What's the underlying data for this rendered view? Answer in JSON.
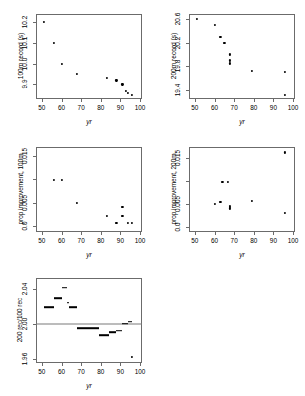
{
  "figure": {
    "background": "#ffffff",
    "point_color": "#000000",
    "axis_color": "#6b6b6b",
    "refline_color": "#7a7a7a"
  },
  "chart_data": [
    {
      "id": "panel-100m-record",
      "type": "scatter",
      "title": "",
      "xlabel": "yr",
      "ylabel": "100m record (s)",
      "xlim": [
        47,
        101
      ],
      "ylim": [
        9.83,
        10.24
      ],
      "xticks": [
        50,
        60,
        70,
        80,
        90,
        100
      ],
      "xticklabels": [
        "50",
        "60",
        "70",
        "80",
        "90",
        "100"
      ],
      "yticks": [
        9.9,
        10.0,
        10.1,
        10.2
      ],
      "yticklabels": [
        "9.9",
        "10.0",
        "10.1",
        "10.2"
      ],
      "grid": false,
      "legend": "none",
      "x": [
        51,
        56,
        60,
        68,
        83,
        88,
        91,
        93,
        94,
        96
      ],
      "y": [
        10.2,
        10.1,
        10.0,
        9.95,
        9.93,
        9.92,
        9.9,
        9.87,
        9.86,
        9.85
      ]
    },
    {
      "id": "panel-200m-record",
      "type": "scatter",
      "title": "",
      "xlabel": "yr",
      "ylabel": "200m record (s)",
      "xlim": [
        47,
        101
      ],
      "ylim": [
        19.25,
        20.68
      ],
      "xticks": [
        50,
        60,
        70,
        80,
        90,
        100
      ],
      "xticklabels": [
        "50",
        "60",
        "70",
        "80",
        "90",
        "100"
      ],
      "yticks": [
        19.4,
        19.8,
        20.2,
        20.6
      ],
      "yticklabels": [
        "19.4",
        "19.8",
        "20.2",
        "20.6"
      ],
      "grid": false,
      "legend": "none",
      "x": [
        51,
        60,
        63,
        65,
        68,
        68,
        68,
        79,
        96,
        96
      ],
      "y": [
        20.6,
        20.5,
        20.3,
        20.2,
        20.0,
        19.9,
        19.85,
        19.72,
        19.7,
        19.32
      ]
    },
    {
      "id": "panel-prop-improvement-100m",
      "type": "scatter",
      "title": "",
      "xlabel": "yr",
      "ylabel": "prop improvement, 100m",
      "xlim": [
        47,
        101
      ],
      "ylim": [
        -0.0012,
        0.0168
      ],
      "xticks": [
        50,
        60,
        70,
        80,
        90,
        100
      ],
      "xticklabels": [
        "50",
        "60",
        "70",
        "80",
        "90",
        "100"
      ],
      "yticks": [
        0.0,
        0.005,
        0.01,
        0.015
      ],
      "yticklabels": [
        "0.0",
        "0.005",
        "",
        "0.015"
      ],
      "grid": false,
      "legend": "none",
      "x": [
        56,
        60,
        68,
        83,
        88,
        91,
        91,
        94,
        96
      ],
      "y": [
        0.0098,
        0.0098,
        0.005,
        0.0022,
        0.0008,
        0.0041,
        0.0022,
        0.0008,
        0.0008
      ]
    },
    {
      "id": "panel-prop-improvement-200m",
      "type": "scatter",
      "title": "",
      "xlabel": "yr",
      "ylabel": "prop improvement, 200m",
      "xlim": [
        47,
        101
      ],
      "ylim": [
        -0.0012,
        0.0175
      ],
      "xticks": [
        50,
        60,
        70,
        80,
        90,
        100
      ],
      "xticklabels": [
        "50",
        "60",
        "70",
        "80",
        "90",
        "100"
      ],
      "yticks": [
        0.0,
        0.005,
        0.01,
        0.015
      ],
      "yticklabels": [
        "0.0",
        "0.005",
        "",
        "0.015"
      ],
      "grid": false,
      "legend": "none",
      "x": [
        60,
        63,
        64,
        67,
        68,
        68,
        68,
        79,
        96,
        96
      ],
      "y": [
        0.0049,
        0.0055,
        0.0098,
        0.0098,
        0.0046,
        0.0043,
        0.004,
        0.0056,
        0.0163,
        0.003
      ]
    },
    {
      "id": "panel-ratio-200-over-100",
      "type": "line",
      "drawstyle": "steps",
      "title": "",
      "xlabel": "yr",
      "ylabel": "200 rec/100 rec",
      "xlim": [
        47,
        101
      ],
      "ylim": [
        1.955,
        2.052
      ],
      "xticks": [
        50,
        60,
        70,
        80,
        90,
        100
      ],
      "xticklabels": [
        "50",
        "60",
        "70",
        "80",
        "90",
        "100"
      ],
      "yticks": [
        1.96,
        2.0,
        2.04
      ],
      "yticklabels": [
        "1.96",
        "2.00",
        "2.04"
      ],
      "grid": false,
      "legend": "none",
      "reference_line_y": 2.0,
      "segments": [
        {
          "x0": 51,
          "x1": 56,
          "y": 2.019
        },
        {
          "x0": 56,
          "x1": 60,
          "y": 2.029
        },
        {
          "x0": 60,
          "x1": 63,
          "y": 2.041
        },
        {
          "x0": 63,
          "x1": 64,
          "y": 2.024
        },
        {
          "x0": 64,
          "x1": 68,
          "y": 2.019
        },
        {
          "x0": 68,
          "x1": 79,
          "y": 1.995
        },
        {
          "x0": 79,
          "x1": 84,
          "y": 1.987
        },
        {
          "x0": 84,
          "x1": 88,
          "y": 1.99
        },
        {
          "x0": 88,
          "x1": 91,
          "y": 1.992
        },
        {
          "x0": 91,
          "x1": 94,
          "y": 2.0
        },
        {
          "x0": 94,
          "x1": 96,
          "y": 2.002
        }
      ],
      "points": [
        {
          "x": 96,
          "y": 1.962
        }
      ]
    }
  ]
}
